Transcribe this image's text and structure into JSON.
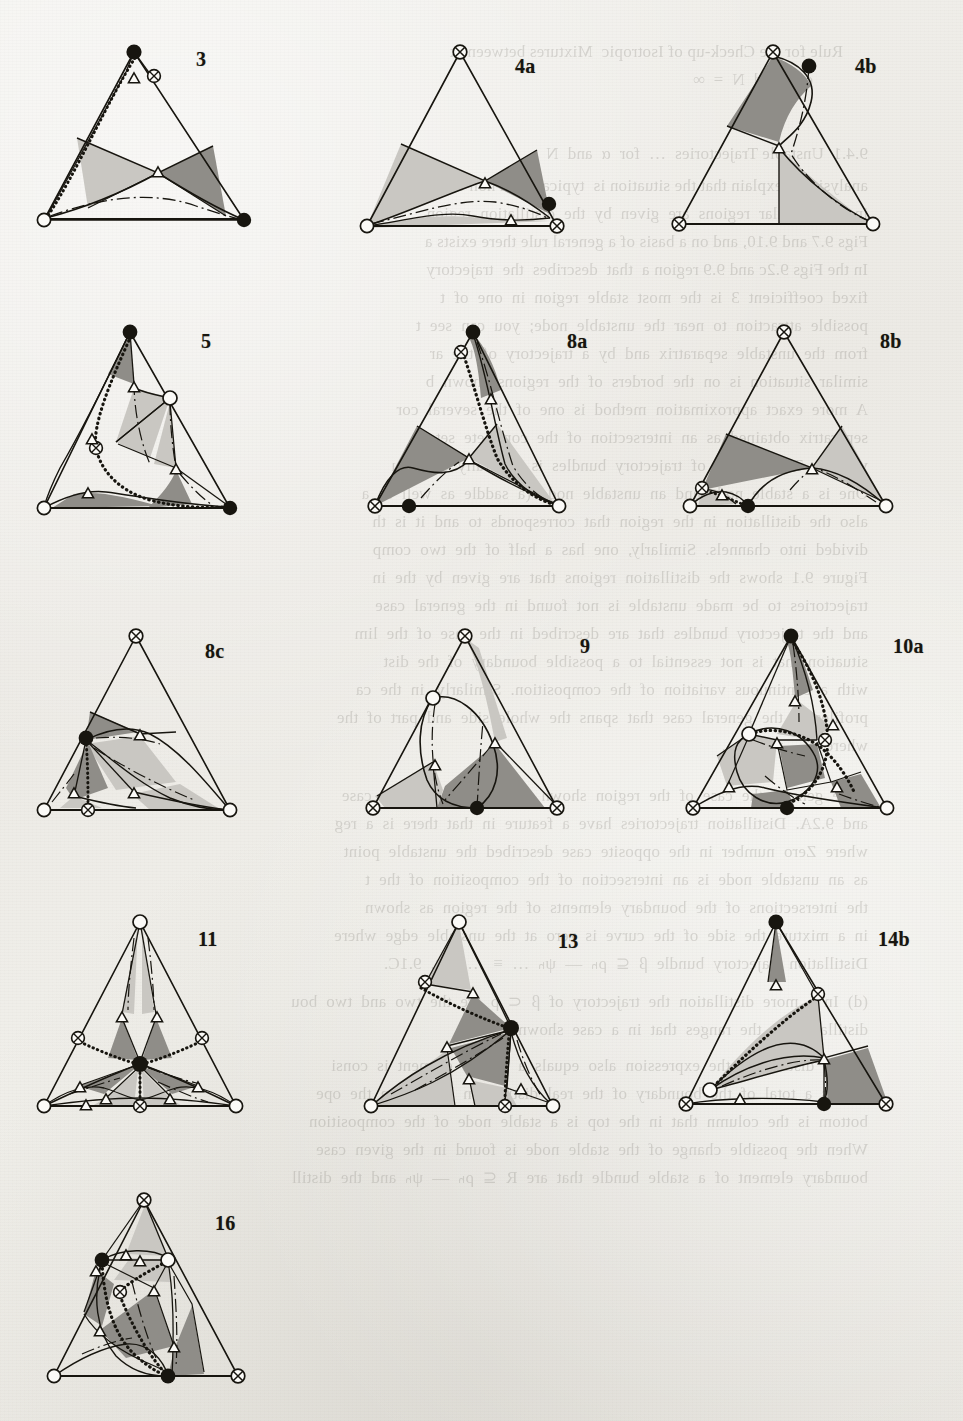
{
  "page": {
    "kind": "scanned-book-figure-plate",
    "width": 963,
    "height": 1421,
    "background_color": "#efeeea",
    "ink_color": "#17150f"
  },
  "legend_semantics": {
    "marker_filled_circle": "stable / filled node",
    "marker_open_circle": "unstable / open node",
    "marker_crossed_circle": "saddle node (circle with X)",
    "marker_open_triangle": "triangular node on boundary curve",
    "shade_light": "#c9c7c2",
    "shade_dark": "#8f8d88",
    "line_solid": "solid boundary",
    "line_dotted": "dotted separatrix",
    "line_dashdot": "dash-dot axis"
  },
  "figures": [
    {
      "id": "fig-3",
      "label": "3",
      "label_x": 196,
      "label_y": 48,
      "x": 30,
      "y": 38,
      "w": 250,
      "h": 218,
      "vertices": {
        "top": "filled",
        "left": "open",
        "right": "filled"
      },
      "extra_markers": [
        "crossed-near-top",
        "triangle-near-top",
        "triangle-center"
      ],
      "has_dotted": true,
      "has_dashdot": true,
      "shaded_regions": 2
    },
    {
      "id": "fig-4a",
      "label": "4a",
      "label_x": 515,
      "label_y": 55,
      "x": 345,
      "y": 38,
      "w": 250,
      "h": 218,
      "vertices": {
        "top": "crossed",
        "left": "open",
        "right": "crossed"
      },
      "extra_markers": [
        "filled-lower-right",
        "triangle-center",
        "triangle-bottom"
      ],
      "has_dotted": false,
      "has_dashdot": true,
      "shaded_regions": 3
    },
    {
      "id": "fig-4b",
      "label": "4b",
      "label_x": 855,
      "label_y": 55,
      "x": 665,
      "y": 38,
      "w": 250,
      "h": 218,
      "vertices": {
        "top": "crossed",
        "left": "crossed",
        "right": "open"
      },
      "extra_markers": [
        "filled-upper-right",
        "triangle-center"
      ],
      "has_dotted": false,
      "has_dashdot": true,
      "shaded_regions": 2
    },
    {
      "id": "fig-5",
      "label": "5",
      "label_x": 201,
      "label_y": 330,
      "x": 30,
      "y": 318,
      "w": 250,
      "h": 218,
      "vertices": {
        "top": "filled",
        "left": "open",
        "right": "filled"
      },
      "extra_markers": [
        "open-right-upper",
        "crossed-left-mid",
        "triangle-x4"
      ],
      "has_dotted": true,
      "has_dashdot": true,
      "shaded_regions": 4
    },
    {
      "id": "fig-8a",
      "label": "8a",
      "label_x": 567,
      "label_y": 330,
      "x": 355,
      "y": 318,
      "w": 250,
      "h": 218,
      "vertices": {
        "top": "filled",
        "left": "crossed",
        "right": "open"
      },
      "extra_markers": [
        "crossed-upper-left",
        "filled-bottom-left",
        "triangle-x2"
      ],
      "has_dotted": true,
      "has_dashdot": true,
      "shaded_regions": 3
    },
    {
      "id": "fig-8b",
      "label": "8b",
      "label_x": 880,
      "label_y": 330,
      "x": 672,
      "y": 318,
      "w": 250,
      "h": 218,
      "vertices": {
        "top": "crossed",
        "left": "open",
        "right": "open"
      },
      "extra_markers": [
        "crossed-left-mid",
        "filled-bottom-mid",
        "triangle-x2"
      ],
      "has_dotted": true,
      "has_dashdot": true,
      "shaded_regions": 3
    },
    {
      "id": "fig-8c",
      "label": "8c",
      "label_x": 205,
      "label_y": 640,
      "x": 30,
      "y": 622,
      "w": 250,
      "h": 218,
      "vertices": {
        "top": "crossed",
        "left": "open",
        "right": "open"
      },
      "extra_markers": [
        "filled-left-mid",
        "crossed-bottom-mid",
        "triangle-x3"
      ],
      "has_dotted": true,
      "has_dashdot": true,
      "shaded_regions": 4
    },
    {
      "id": "fig-9",
      "label": "9",
      "label_x": 580,
      "label_y": 635,
      "x": 355,
      "y": 622,
      "w": 250,
      "h": 218,
      "vertices": {
        "top": "crossed",
        "left": "crossed",
        "right": "crossed"
      },
      "extra_markers": [
        "open-upper-left",
        "filled-bottom-mid",
        "triangle-x2"
      ],
      "has_dotted": false,
      "has_dashdot": true,
      "shaded_regions": 3
    },
    {
      "id": "fig-10a",
      "label": "10a",
      "label_x": 893,
      "label_y": 635,
      "x": 665,
      "y": 622,
      "w": 260,
      "h": 218,
      "vertices": {
        "top": "filled",
        "left": "crossed",
        "right": "open"
      },
      "extra_markers": [
        "open-left-mid",
        "crossed-right-mid",
        "filled-bottom-mid",
        "triangle-x5"
      ],
      "has_dotted": true,
      "has_dashdot": true,
      "shaded_regions": 5
    },
    {
      "id": "fig-11",
      "label": "11",
      "label_x": 198,
      "label_y": 928,
      "x": 30,
      "y": 908,
      "w": 260,
      "h": 230,
      "vertices": {
        "top": "open",
        "left": "open",
        "right": "open"
      },
      "extra_markers": [
        "filled-center",
        "crossed-x3",
        "triangle-x7"
      ],
      "has_dotted": true,
      "has_dashdot": true,
      "shaded_regions": 6
    },
    {
      "id": "fig-13",
      "label": "13",
      "label_x": 558,
      "label_y": 930,
      "x": 355,
      "y": 908,
      "w": 255,
      "h": 230,
      "vertices": {
        "top": "open",
        "left": "open",
        "right": "open"
      },
      "extra_markers": [
        "crossed-upper-left",
        "filled-right-mid",
        "crossed-bottom-mid",
        "triangle-x4"
      ],
      "has_dotted": true,
      "has_dashdot": true,
      "shaded_regions": 4
    },
    {
      "id": "fig-14b",
      "label": "14b",
      "label_x": 878,
      "label_y": 928,
      "x": 672,
      "y": 908,
      "w": 258,
      "h": 230,
      "vertices": {
        "top": "filled",
        "left": "crossed",
        "right": "crossed"
      },
      "extra_markers": [
        "crossed-upper-right",
        "open-left-mid",
        "filled-bottom-mid",
        "triangle-x3"
      ],
      "has_dotted": true,
      "has_dashdot": true,
      "shaded_regions": 3
    },
    {
      "id": "fig-16",
      "label": "16",
      "label_x": 215,
      "label_y": 1212,
      "x": 40,
      "y": 1186,
      "w": 250,
      "h": 222,
      "vertices": {
        "top": "crossed",
        "left": "open",
        "right": "crossed"
      },
      "extra_markers": [
        "filled-upper-left",
        "open-upper-right",
        "crossed-mid",
        "filled-bottom-mid",
        "triangle-x6"
      ],
      "has_dotted": true,
      "has_dashdot": true,
      "shaded_regions": 5
    }
  ],
  "bleed_text": {
    "note": "faint mirrored show-through from the reverse page; rendered reversed and very low contrast",
    "lines": [
      {
        "x": 120,
        "y": 38,
        "text": "Rule for the Check-up of Isotropic  Mixtures between  x"
      },
      {
        "x": 150,
        "y": 66,
        "text": "e  x  and  N  =  ∞"
      },
      {
        "x": 95,
        "y": 140,
        "text": "9.4.1  Unstable Trajectories  …  for  α  and  N"
      },
      {
        "x": 95,
        "y": 172,
        "text": "analysis we explain that the situation is  typical for a non-sharp"
      },
      {
        "x": 95,
        "y": 200,
        "text": "in  the  singular  regions  are  given  by  the  distillation  region"
      },
      {
        "x": 95,
        "y": 228,
        "text": "Figs 9.7 and 9.10, and on a basis of a general rule there exists a"
      },
      {
        "x": 95,
        "y": 256,
        "text": "In the Figs 9.2c and 9.9 region a  that  describes  the  trajectory"
      },
      {
        "x": 95,
        "y": 284,
        "text": "fixed  coefficient  3  is  the  most  stable  region  in  one  of  t"
      },
      {
        "x": 95,
        "y": 312,
        "text": "possible  attraction  to  near  the  unstable  node;  you  can  see  t"
      },
      {
        "x": 95,
        "y": 340,
        "text": "from  the  unstable  separatrix  and  by  a  trajectory  of  the  ar"
      },
      {
        "x": 95,
        "y": 368,
        "text": "similar  situation  is  on  the  borders  of  the  regions  shown  b"
      },
      {
        "x": 95,
        "y": 396,
        "text": "A  more  exact  approximation  method  is  one  of  the  several  cor"
      },
      {
        "x": 95,
        "y": 424,
        "text": "separatrix  obtained  as  an  intersection  of  the  complete  sets"
      },
      {
        "x": 95,
        "y": 452,
        "text": "volume.  The  domain  of  trajectory  bundles  is  generally  a  produ"
      },
      {
        "x": 95,
        "y": 480,
        "text": "One  is  a  stable  node  and  an  unstable  node  (a  saddle  as  well  as  a"
      },
      {
        "x": 95,
        "y": 508,
        "text": "also  the  distillation  in  the  region  that  corresponds  to  and  it  is  th"
      },
      {
        "x": 95,
        "y": 536,
        "text": "divided  into  channels.  Similarly,  one  has  a  half  of  the  two  comp"
      },
      {
        "x": 95,
        "y": 564,
        "text": "Figure  9.1  shows  the  distillation  regions  that  are  given  by  the  in"
      },
      {
        "x": 95,
        "y": 592,
        "text": "trajectories  to  be  made  unstable  is  not  found  in  the  general  case"
      },
      {
        "x": 95,
        "y": 620,
        "text": "and  the  trajectory  bundles  that  are  described  in  the  case  of  the  lim"
      },
      {
        "x": 95,
        "y": 648,
        "text": "situation  that  is  not  essential  to  a  possible  boundary  of  the  dist"
      },
      {
        "x": 95,
        "y": 676,
        "text": "with  a  continuous  variation  of  the  composition.  Similarly,  in  the  ca"
      },
      {
        "x": 95,
        "y": 704,
        "text": "profiles  in  the  general  case  that  spans  the  whole  side  and  part  of  the"
      },
      {
        "x": 95,
        "y": 732,
        "text": "where  Nₘ  ≠  Nₛ  …"
      },
      {
        "x": 95,
        "y": 782,
        "text": "more  general  the  case  of  the  region  shown  in  Figure  9.2  in  the  case"
      },
      {
        "x": 95,
        "y": 810,
        "text": "and  9.2A.  Distillation  trajectories  have  a  feature  in  that  there  is  a  reg"
      },
      {
        "x": 95,
        "y": 838,
        "text": "where  Zero  number  in  the  opposite  case  described  the  unstable  point"
      },
      {
        "x": 95,
        "y": 866,
        "text": "as  an  unstable  node  is  an  intersection  of  the  composition  of  the  t"
      },
      {
        "x": 95,
        "y": 894,
        "text": "the  intersections  of  the  boundary  elements  of  the  region  as  shown"
      },
      {
        "x": 95,
        "y": 922,
        "text": "in  a  mixture  the  side  of  the  curve  is  zero  at  the  unstable  edge  where"
      },
      {
        "x": 95,
        "y": 950,
        "text": "Distillation  trajectory  bundle  β  ⊆  ρₕ  —  ψₕ  …  ≡  …  Fig.  9.1C."
      },
      {
        "x": 95,
        "y": 988,
        "text": "(d)  In  a  more  distillation  the  trajectory  of  β  ⊂  ρ  are  the  two  and  two  bou"
      },
      {
        "x": 95,
        "y": 1016,
        "text": "distillation  in  the  ranges  that  in  a  case  shown."
      },
      {
        "x": 95,
        "y": 1052,
        "text": "In  the  distillation  the  expression  also  equals  a  bundle  element  is  consi"
      },
      {
        "x": 95,
        "y": 1080,
        "text": "that  is  a  total  of  the  boundary  of  the  real  distillation  bundle  on  the  ope"
      },
      {
        "x": 95,
        "y": 1108,
        "text": "bottom  is  the  column  that  in  the  top  is  a  stable  node  of  the  composition"
      },
      {
        "x": 95,
        "y": 1136,
        "text": "When  the  possible  change  of  the  stable  node  is  found  in  the  given  case"
      },
      {
        "x": 95,
        "y": 1164,
        "text": "boundary  element  of  a  stable  bundle  that  are  R  ⊆  ρₕ  —  ψₕ  and  the  distill"
      }
    ]
  }
}
